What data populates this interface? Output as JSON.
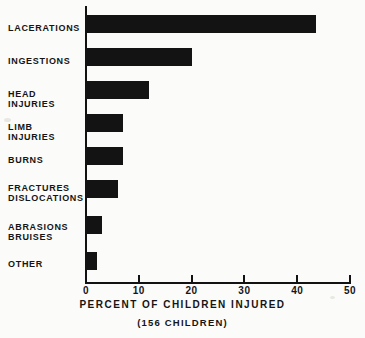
{
  "chart_data": {
    "type": "bar",
    "orientation": "horizontal",
    "title": "",
    "xlabel": "PERCENT OF CHILDREN INJURED",
    "sublabel": "(156 CHILDREN)",
    "ylabel": "",
    "categories": [
      "LACERATIONS",
      "INGESTIONS",
      "HEAD INJURIES",
      "LIMB INJURIES",
      "BURNS",
      "FRACTURES\nDISLOCATIONS",
      "ABRASIONS\nBRUISES",
      "OTHER"
    ],
    "values": [
      43.5,
      20,
      12,
      7,
      7,
      6,
      3,
      2
    ],
    "xlim": [
      0,
      50
    ],
    "xticks": [
      0,
      10,
      20,
      30,
      40,
      50
    ],
    "xtick_labels": [
      "0",
      "10",
      "20",
      "30",
      "40",
      "50"
    ],
    "grid": false,
    "legend": false,
    "bar_color": "#131313",
    "axis_color": "#121212",
    "background_color": "#fbfbf9",
    "total_children": 156
  }
}
